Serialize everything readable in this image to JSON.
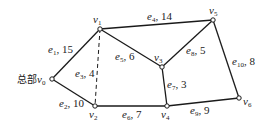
{
  "diagram": {
    "type": "weighted-graph",
    "background": "#ffffff",
    "line_color": "#1a1a1a",
    "nodes": [
      {
        "id": "v0",
        "label": "v",
        "sub": "0",
        "prefix": "总部",
        "x": 52,
        "y": 79
      },
      {
        "id": "v1",
        "label": "v",
        "sub": "1",
        "x": 100,
        "y": 29
      },
      {
        "id": "v2",
        "label": "v",
        "sub": "2",
        "x": 95,
        "y": 106
      },
      {
        "id": "v3",
        "label": "v",
        "sub": "3",
        "x": 162,
        "y": 67
      },
      {
        "id": "v4",
        "label": "v",
        "sub": "4",
        "x": 167,
        "y": 106
      },
      {
        "id": "v5",
        "label": "v",
        "sub": "5",
        "x": 213,
        "y": 20
      },
      {
        "id": "v6",
        "label": "v",
        "sub": "6",
        "x": 239,
        "y": 98
      }
    ],
    "edges": [
      {
        "id": "e1",
        "from": "v0",
        "to": "v1",
        "name": "e",
        "sub": "1",
        "weight": "15",
        "style": "solid"
      },
      {
        "id": "e2",
        "from": "v0",
        "to": "v2",
        "name": "e",
        "sub": "2",
        "weight": "10",
        "style": "solid"
      },
      {
        "id": "e3",
        "from": "v1",
        "to": "v2",
        "name": "e",
        "sub": "3",
        "weight": "4",
        "style": "dashed"
      },
      {
        "id": "e4",
        "from": "v1",
        "to": "v5",
        "name": "e",
        "sub": "4",
        "weight": "14",
        "style": "solid"
      },
      {
        "id": "e5",
        "from": "v1",
        "to": "v3",
        "name": "e",
        "sub": "5",
        "weight": "6",
        "style": "solid"
      },
      {
        "id": "e6",
        "from": "v2",
        "to": "v4",
        "name": "e",
        "sub": "6",
        "weight": "7",
        "style": "solid"
      },
      {
        "id": "e7",
        "from": "v3",
        "to": "v4",
        "name": "e",
        "sub": "7",
        "weight": "3",
        "style": "solid"
      },
      {
        "id": "e8",
        "from": "v3",
        "to": "v5",
        "name": "e",
        "sub": "8",
        "weight": "5",
        "style": "solid"
      },
      {
        "id": "e9",
        "from": "v4",
        "to": "v6",
        "name": "e",
        "sub": "9",
        "weight": "9",
        "style": "solid"
      },
      {
        "id": "e10",
        "from": "v5",
        "to": "v6",
        "name": "e",
        "sub": "10",
        "weight": "8",
        "style": "solid"
      }
    ]
  }
}
